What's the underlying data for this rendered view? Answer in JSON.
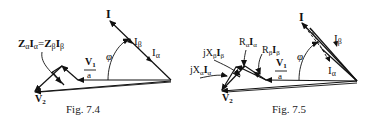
{
  "figures": [
    {
      "id": "fig-7-4",
      "caption": "Fig. 7.4",
      "labels": {
        "current_total": "I",
        "current_beta": "I",
        "current_beta_sub": "β",
        "current_alpha": "I",
        "current_alpha_sub": "α",
        "phase_angle": "φ",
        "v1_num": "V",
        "v1_num_sub": "1",
        "v1_den": "a",
        "v2": "V",
        "v2_sub": "2",
        "impedance_drop": "ZαIα= ZβIβ",
        "z_alpha": "Z",
        "z_alpha_sub": "α",
        "i_alpha": "I",
        "i_alpha_sub": "α",
        "eq": "=",
        "z_beta": "Z",
        "z_beta_sub": "β",
        "i_beta": "I",
        "i_beta_sub": "β"
      }
    },
    {
      "id": "fig-7-5",
      "caption": "Fig. 7.5",
      "labels": {
        "current_total": "I",
        "current_beta": "I",
        "current_beta_sub": "β",
        "current_alpha": "I",
        "current_alpha_sub": "α",
        "phase_angle": "φ",
        "v1_num": "V",
        "v1_num_sub": "1",
        "v1_den": "a",
        "v2": "V",
        "v2_sub": "2",
        "r_alpha": "R",
        "r_alpha_sub": "α",
        "r_alpha_i": "I",
        "r_alpha_i_sub": "α",
        "r_beta": "R",
        "r_beta_sub": "β",
        "r_beta_i": "I",
        "r_beta_i_sub": "β",
        "jx_beta": "jX",
        "jx_beta_sub": "β",
        "jx_beta_i": "I",
        "jx_beta_i_sub": "β",
        "jx_alpha": "jX",
        "jx_alpha_sub": "α",
        "jx_alpha_i": "I",
        "jx_alpha_i_sub": "α"
      }
    }
  ]
}
